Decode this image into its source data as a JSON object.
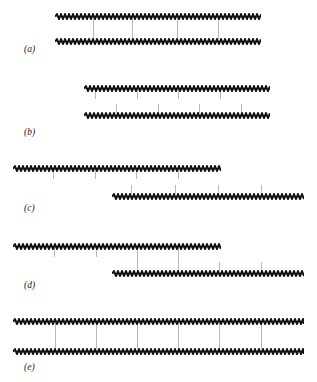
{
  "figure": {
    "title": "",
    "width": 317,
    "height": 382,
    "background": "#ffffff",
    "strand_color": "#111111",
    "connector_color": "#b9b9b9",
    "label_color": "#1a1a1a"
  },
  "panels": [
    {
      "id": "a",
      "label": "(a)",
      "label_x": 24,
      "label_y": 44,
      "strands": [
        {
          "name": "top-strand",
          "x": 55,
          "y": 13,
          "width": 206
        },
        {
          "name": "bottom-strand",
          "x": 55,
          "y": 38,
          "width": 206
        }
      ],
      "connectors": [
        {
          "x": 93,
          "y": 18,
          "height": 21
        },
        {
          "x": 132,
          "y": 18,
          "height": 21
        },
        {
          "x": 177,
          "y": 18,
          "height": 21
        },
        {
          "x": 218,
          "y": 18,
          "height": 21
        }
      ],
      "ticks": []
    },
    {
      "id": "b",
      "label": "(b)",
      "label_x": 24,
      "label_y": 127,
      "strands": [
        {
          "name": "top-strand",
          "x": 84,
          "y": 85,
          "width": 186
        },
        {
          "name": "bottom-strand",
          "x": 84,
          "y": 112,
          "width": 186
        }
      ],
      "connectors": [],
      "ticks": [
        {
          "x": 95,
          "y": 90,
          "height": 9
        },
        {
          "x": 137,
          "y": 90,
          "height": 9
        },
        {
          "x": 178,
          "y": 90,
          "height": 9
        },
        {
          "x": 220,
          "y": 90,
          "height": 9
        },
        {
          "x": 116,
          "y": 104,
          "height": 9
        },
        {
          "x": 158,
          "y": 104,
          "height": 9
        },
        {
          "x": 199,
          "y": 104,
          "height": 9
        },
        {
          "x": 241,
          "y": 104,
          "height": 9
        }
      ]
    },
    {
      "id": "c",
      "label": "(c)",
      "label_x": 24,
      "label_y": 203,
      "strands": [
        {
          "name": "top-strand",
          "x": 13,
          "y": 165,
          "width": 208
        },
        {
          "name": "bottom-strand",
          "x": 112,
          "y": 193,
          "width": 192
        }
      ],
      "connectors": [],
      "ticks": [
        {
          "x": 53,
          "y": 170,
          "height": 9
        },
        {
          "x": 95,
          "y": 170,
          "height": 9
        },
        {
          "x": 136,
          "y": 170,
          "height": 9
        },
        {
          "x": 178,
          "y": 170,
          "height": 9
        },
        {
          "x": 131,
          "y": 185,
          "height": 9
        },
        {
          "x": 175,
          "y": 185,
          "height": 9
        },
        {
          "x": 218,
          "y": 185,
          "height": 9
        },
        {
          "x": 261,
          "y": 185,
          "height": 9
        }
      ]
    },
    {
      "id": "d",
      "label": "(d)",
      "label_x": 24,
      "label_y": 280,
      "strands": [
        {
          "name": "top-strand",
          "x": 13,
          "y": 243,
          "width": 208
        },
        {
          "name": "bottom-strand",
          "x": 112,
          "y": 270,
          "width": 192
        }
      ],
      "connectors": [
        {
          "x": 137,
          "y": 248,
          "height": 23
        },
        {
          "x": 178,
          "y": 248,
          "height": 23
        }
      ],
      "ticks": [
        {
          "x": 54,
          "y": 248,
          "height": 9
        },
        {
          "x": 96,
          "y": 248,
          "height": 9
        },
        {
          "x": 219,
          "y": 262,
          "height": 9
        },
        {
          "x": 261,
          "y": 262,
          "height": 9
        }
      ]
    },
    {
      "id": "e",
      "label": "(e)",
      "label_x": 24,
      "label_y": 362,
      "strands": [
        {
          "name": "top-strand",
          "x": 13,
          "y": 318,
          "width": 291
        },
        {
          "name": "bottom-strand",
          "x": 13,
          "y": 348,
          "width": 291
        }
      ],
      "connectors": [
        {
          "x": 55,
          "y": 323,
          "height": 26
        },
        {
          "x": 96,
          "y": 323,
          "height": 26
        },
        {
          "x": 137,
          "y": 323,
          "height": 26
        },
        {
          "x": 178,
          "y": 323,
          "height": 26
        },
        {
          "x": 219,
          "y": 323,
          "height": 26
        },
        {
          "x": 261,
          "y": 323,
          "height": 26
        }
      ],
      "ticks": []
    }
  ]
}
